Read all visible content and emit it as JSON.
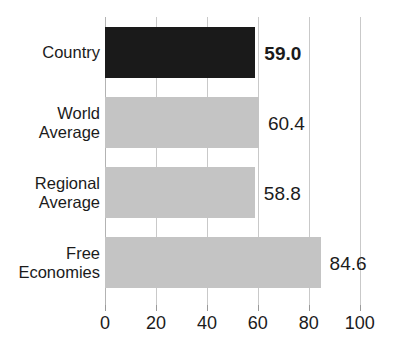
{
  "chart_data": {
    "type": "bar",
    "orientation": "horizontal",
    "title": "",
    "xlabel": "",
    "ylabel": "",
    "categories": [
      "Country",
      "World Average",
      "Regional Average",
      "Free Economies"
    ],
    "category_lines": [
      [
        "Country"
      ],
      [
        "World",
        "Average"
      ],
      [
        "Regional",
        "Average"
      ],
      [
        "Free",
        "Economies"
      ]
    ],
    "values": [
      59.0,
      58.8,
      60.4,
      84.6
    ],
    "series": [
      {
        "name": "Score",
        "values": [
          59.0,
          60.4,
          58.8,
          84.6
        ]
      }
    ],
    "value_labels": [
      "59.0",
      "60.4",
      "58.8",
      "84.6"
    ],
    "highlighted_index": 0,
    "bar_colors": [
      "#1a1a1a",
      "#c4c4c4",
      "#c4c4c4",
      "#c4c4c4"
    ],
    "xlim": [
      0,
      104
    ],
    "xticks": [
      0,
      20,
      40,
      60,
      80,
      100
    ],
    "xtick_labels": [
      "0",
      "20",
      "40",
      "60",
      "80",
      "100"
    ],
    "grid": true,
    "grid_axis": "x",
    "legend": "none",
    "colors": {
      "highlight_bar": "#1a1a1a",
      "default_bar": "#c4c4c4",
      "gridline": "#c9c9c9",
      "text": "#1b1b1b",
      "background": "#ffffff"
    }
  },
  "bars": [
    {
      "label_line1": "Country",
      "label_line2": "",
      "value_label": "59.0",
      "value": 59.0,
      "color": "#1a1a1a",
      "bold": true
    },
    {
      "label_line1": "World",
      "label_line2": "Average",
      "value_label": "60.4",
      "value": 60.4,
      "color": "#c4c4c4",
      "bold": false
    },
    {
      "label_line1": "Regional",
      "label_line2": "Average",
      "value_label": "58.8",
      "value": 58.8,
      "color": "#c4c4c4",
      "bold": false
    },
    {
      "label_line1": "Free",
      "label_line2": "Economies",
      "value_label": "84.6",
      "value": 84.6,
      "color": "#c4c4c4",
      "bold": false
    }
  ],
  "axis": {
    "ticks": [
      "0",
      "20",
      "40",
      "60",
      "80",
      "100"
    ]
  },
  "title": {
    "text": ""
  }
}
